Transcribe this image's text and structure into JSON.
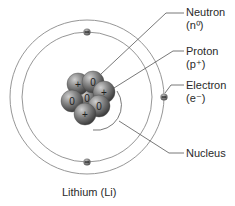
{
  "diagram": {
    "title": "Lithium (Li)",
    "labels": {
      "neutron": {
        "name": "Neutron",
        "symbol": "(n⁰)"
      },
      "proton": {
        "name": "Proton",
        "symbol": "(p⁺)"
      },
      "electron": {
        "name": "Electron",
        "symbol": "(e⁻)"
      },
      "nucleus": {
        "name": "Nucleus"
      }
    },
    "nucleus_particles": [
      {
        "type": "proton",
        "sign": "+",
        "cx": 78,
        "cy": 84
      },
      {
        "type": "neutron",
        "sign": "0",
        "cx": 93,
        "cy": 82
      },
      {
        "type": "proton",
        "sign": "+",
        "cx": 104,
        "cy": 92
      },
      {
        "type": "neutron",
        "sign": "0",
        "cx": 72,
        "cy": 101
      },
      {
        "type": "neutron",
        "sign": "0",
        "cx": 87,
        "cy": 98
      },
      {
        "type": "neutron",
        "sign": "0",
        "cx": 99,
        "cy": 106
      },
      {
        "type": "proton",
        "sign": "+",
        "cx": 85,
        "cy": 114
      }
    ],
    "orbits": [
      {
        "name": "inner-orbit",
        "cx": 87,
        "cy": 97,
        "r": 65
      },
      {
        "name": "outer-orbit",
        "cx": 87,
        "cy": 97,
        "r": 77
      }
    ],
    "electrons": [
      {
        "cx": 87,
        "cy": 32
      },
      {
        "cx": 87,
        "cy": 162
      },
      {
        "cx": 164,
        "cy": 97
      }
    ],
    "colors": {
      "particle": "#7a7a7a",
      "particle_highlight": "#c8c8c8",
      "particle_shadow": "#3c3c3c",
      "orbit": "#8a8a8a",
      "leader": "#555555",
      "electron": "#5a5a5a",
      "text": "#2a2a2a"
    }
  }
}
